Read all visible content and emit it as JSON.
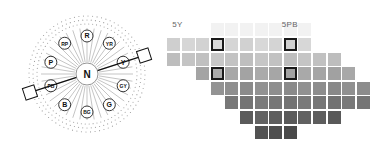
{
  "hue_wheel": {
    "center_label": "N",
    "hue_labels": [
      {
        "label": "R",
        "angle": 0
      },
      {
        "label": "YR",
        "angle": 36
      },
      {
        "label": "Y",
        "angle": 72
      },
      {
        "label": "GY",
        "angle": 108
      },
      {
        "label": "G",
        "angle": 144
      },
      {
        "label": "BG",
        "angle": 180
      },
      {
        "label": "B",
        "angle": 216
      },
      {
        "label": "PB",
        "angle": 252
      },
      {
        "label": "P",
        "angle": 288
      },
      {
        "label": "RP",
        "angle": 324
      }
    ],
    "selected_axis": {
      "from_angle": 252,
      "to_angle": 72
    }
  },
  "chroma_grid": {
    "column_labels": [
      {
        "label": "5Y",
        "col": 0.5
      },
      {
        "label": "5PB",
        "col": 8
      }
    ],
    "rows": [
      {
        "row": 0,
        "start": 0,
        "end": 9,
        "shade": "#d4d4d4",
        "highlight": [
          3,
          8
        ]
      },
      {
        "row": 1,
        "start": 0,
        "end": 11,
        "shade": "#c2c2c2",
        "highlight": []
      },
      {
        "row": 2,
        "start": 2,
        "end": 12,
        "shade": "#a6a6a6",
        "highlight": [
          3,
          8
        ]
      },
      {
        "row": 3,
        "start": 3,
        "end": 13,
        "shade": "#8e8e8e",
        "highlight": []
      },
      {
        "row": 4,
        "start": 4,
        "end": 13,
        "shade": "#777777",
        "highlight": []
      },
      {
        "row": 5,
        "start": 5,
        "end": 11,
        "shade": "#5e5e5e",
        "highlight": []
      },
      {
        "row": 6,
        "start": 6,
        "end": 8,
        "shade": "#4e4e4e",
        "highlight": []
      }
    ],
    "faint_row": {
      "start": 3,
      "end": 9,
      "shade": "#f2f2f2"
    }
  }
}
